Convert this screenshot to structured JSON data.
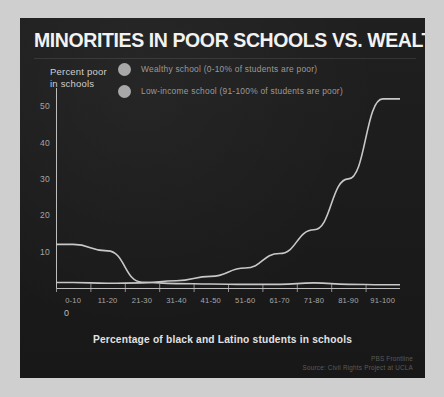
{
  "figure": {
    "title": "MINORITIES IN POOR SCHOOLS VS. WEALTHY SCHOOLS",
    "panel_background": "#1b1b1b",
    "page_background": "#cfcfcf",
    "line_color": "#c8c8c8",
    "legend_dot_color": "#a8a8a8"
  },
  "credits": {
    "outlet": "PBS Frontline",
    "source": "Source: Civil Rights Project at UCLA"
  },
  "chart_data": {
    "type": "line",
    "title": "MINORITIES IN POOR SCHOOLS VS. WEALTHY SCHOOLS",
    "subtitle": "",
    "xlabel": "Percentage of black and Latino students in schools",
    "ylabel": "Percent poor\nin schools",
    "ylabel_line1": "Percent poor",
    "ylabel_line2": "in schools",
    "categories": [
      "0-10",
      "11-20",
      "21-30",
      "31-40",
      "41-50",
      "51-60",
      "61-70",
      "71-80",
      "81-90",
      "91-100"
    ],
    "xlim": [
      0,
      10
    ],
    "ylim": [
      0,
      55
    ],
    "yticks": [
      0,
      10,
      20,
      30,
      40,
      50
    ],
    "ytick_labels": [
      "0",
      "10",
      "20",
      "30",
      "40",
      "50"
    ],
    "origin_label": "0",
    "grid": false,
    "legend_position": "upper-left-inside",
    "series": [
      {
        "name": "Wealthy school (0-10% of students are poor)",
        "short_name": "wealthy-school",
        "values": [
          12,
          10.2,
          1.6,
          1.2,
          1.1,
          1.0,
          1.0,
          1.4,
          1.0,
          0.9
        ]
      },
      {
        "name": "Low-income school (91-100% of students are poor)",
        "short_name": "low-income-school",
        "values": [
          1.5,
          1.3,
          1.4,
          2.0,
          3.2,
          5.5,
          9.5,
          16.0,
          30.0,
          52.0
        ]
      }
    ]
  }
}
